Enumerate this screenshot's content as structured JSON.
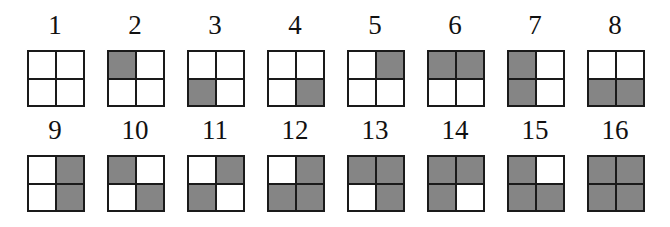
{
  "figure": {
    "fill_color": "#858585",
    "empty_color": "#ffffff",
    "border_color": "#1a1a1a",
    "quadrant_order": [
      "top-left",
      "top-right",
      "bottom-left",
      "bottom-right"
    ],
    "items": [
      {
        "label": "1",
        "cells": [
          0,
          0,
          0,
          0
        ]
      },
      {
        "label": "2",
        "cells": [
          1,
          0,
          0,
          0
        ]
      },
      {
        "label": "3",
        "cells": [
          0,
          0,
          1,
          0
        ]
      },
      {
        "label": "4",
        "cells": [
          0,
          0,
          0,
          1
        ]
      },
      {
        "label": "5",
        "cells": [
          0,
          1,
          0,
          0
        ]
      },
      {
        "label": "6",
        "cells": [
          1,
          1,
          0,
          0
        ]
      },
      {
        "label": "7",
        "cells": [
          1,
          0,
          1,
          0
        ]
      },
      {
        "label": "8",
        "cells": [
          0,
          0,
          1,
          1
        ]
      },
      {
        "label": "9",
        "cells": [
          0,
          1,
          0,
          1
        ]
      },
      {
        "label": "10",
        "cells": [
          1,
          0,
          0,
          1
        ]
      },
      {
        "label": "11",
        "cells": [
          0,
          1,
          1,
          0
        ]
      },
      {
        "label": "12",
        "cells": [
          0,
          1,
          1,
          1
        ]
      },
      {
        "label": "13",
        "cells": [
          1,
          1,
          0,
          1
        ]
      },
      {
        "label": "14",
        "cells": [
          1,
          1,
          1,
          0
        ]
      },
      {
        "label": "15",
        "cells": [
          1,
          0,
          1,
          1
        ]
      },
      {
        "label": "16",
        "cells": [
          1,
          1,
          1,
          1
        ]
      }
    ]
  }
}
